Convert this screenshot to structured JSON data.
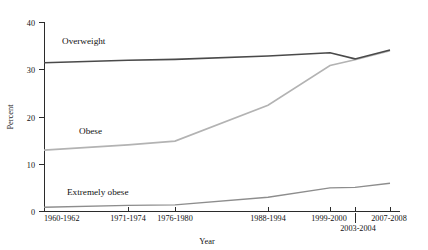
{
  "chart_data": {
    "type": "line",
    "title": "",
    "xlabel": "Year",
    "ylabel": "Percent",
    "ylim": [
      0,
      40
    ],
    "yticks": [
      0,
      10,
      20,
      30,
      40
    ],
    "ytick_labels": [
      "0",
      "10",
      "20",
      "30",
      "40"
    ],
    "grid": false,
    "legend": "inline-labels",
    "categories": [
      "1960-1962",
      "1971-1974",
      "1976-1980",
      "1988-1994",
      "1999-2000",
      "2003-2004",
      "2007-2008"
    ],
    "category_positions": [
      44,
      128,
      175,
      268,
      330,
      355,
      390
    ],
    "series": [
      {
        "name": "Overweight",
        "color": "#4a4a4a",
        "width": 1.6,
        "values": [
          31.5,
          32.0,
          32.2,
          32.9,
          33.6,
          32.3,
          34.2
        ],
        "label_x": 62,
        "label_y": 44
      },
      {
        "name": "Obese",
        "color": "#b3b3b3",
        "width": 1.6,
        "values": [
          13.0,
          14.1,
          14.9,
          22.5,
          30.9,
          32.1,
          34.0
        ],
        "label_x": 79,
        "label_y": 134
      },
      {
        "name": "Extremely obese",
        "color": "#8d8d8d",
        "width": 1.4,
        "values": [
          0.9,
          1.3,
          1.4,
          3.0,
          5.0,
          5.1,
          6.0
        ],
        "label_x": 67,
        "label_y": 195
      }
    ]
  },
  "axis": {
    "y_title": "Percent",
    "x_title": "Year"
  }
}
